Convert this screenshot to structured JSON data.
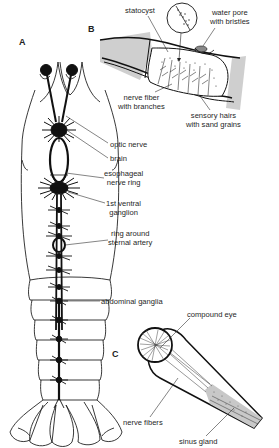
{
  "panels": {
    "A": "A",
    "B": "B",
    "C": "C"
  },
  "labels_A": {
    "optic_nerve": "optic nerve",
    "brain": "brain",
    "esophageal_1": "esophageal",
    "esophageal_2": "nerve ring",
    "ventral_1": "1st ventral",
    "ventral_2": "ganglion",
    "ring_1": "ring around",
    "ring_2": "sternal artery",
    "abdominal_ganglia": "abdominal ganglia"
  },
  "labels_B": {
    "statocyst": "statocyst",
    "water_pore_1": "water pore",
    "water_pore_2": "with bristles",
    "nerve_fiber_1": "nerve fiber",
    "nerve_fiber_2": "with branches",
    "sensory_1": "sensory hairs",
    "sensory_2": "with sand grains"
  },
  "labels_C": {
    "compound_eye": "compound eye",
    "nerve_fibers": "nerve fibers",
    "sinus_gland": "sinus gland"
  }
}
